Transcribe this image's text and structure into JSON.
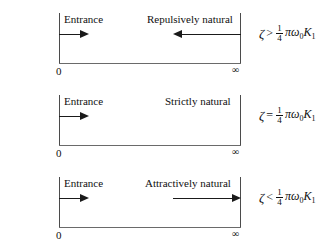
{
  "figure": {
    "name": "stability-regime-diagram",
    "rows": [
      {
        "id": "row-repulsively-natural",
        "entrance_label": "Entrance",
        "regime_label": "Repulsively natural",
        "regime_label_left_px": 147,
        "arrows": [
          {
            "direction": "right",
            "left_px": 59,
            "width_px": 30,
            "top_px": 30
          },
          {
            "direction": "left",
            "left_px": 173,
            "width_px": 68,
            "top_px": 30
          }
        ],
        "start_tick_label": "0",
        "end_tick_label": "∞",
        "formula": {
          "variable": "ζ",
          "relation": ">",
          "fraction_numerator": "1",
          "fraction_denominator": "4",
          "tail_pi": "π",
          "tail_omega": "ω",
          "tail_omega_sub": "0",
          "tail_k": "K",
          "tail_k_sub": "1"
        }
      },
      {
        "id": "row-strictly-natural",
        "entrance_label": "Entrance",
        "regime_label": "Strictly natural",
        "regime_label_left_px": 165,
        "arrows": [
          {
            "direction": "right",
            "left_px": 59,
            "width_px": 30,
            "top_px": 30
          }
        ],
        "start_tick_label": "0",
        "end_tick_label": "∞",
        "formula": {
          "variable": "ζ",
          "relation": "=",
          "fraction_numerator": "1",
          "fraction_denominator": "4",
          "tail_pi": "π",
          "tail_omega": "ω",
          "tail_omega_sub": "0",
          "tail_k": "K",
          "tail_k_sub": "1"
        }
      },
      {
        "id": "row-attractively-natural",
        "entrance_label": "Entrance",
        "regime_label": "Attractively natural",
        "regime_label_left_px": 145,
        "arrows": [
          {
            "direction": "right",
            "left_px": 59,
            "width_px": 30,
            "top_px": 30
          },
          {
            "direction": "right",
            "left_px": 173,
            "width_px": 68,
            "top_px": 30
          }
        ],
        "start_tick_label": "0",
        "end_tick_label": "∞",
        "formula": {
          "variable": "ζ",
          "relation": "<",
          "fraction_numerator": "1",
          "fraction_denominator": "4",
          "tail_pi": "π",
          "tail_omega": "ω",
          "tail_omega_sub": "0",
          "tail_k": "K",
          "tail_k_sub": "1"
        }
      }
    ],
    "colors": {
      "background": "#ffffff",
      "axis": "#4b4b4b",
      "baseline": "#6a6a6a",
      "arrow": "#1a1a1a",
      "text": "#101010"
    }
  }
}
